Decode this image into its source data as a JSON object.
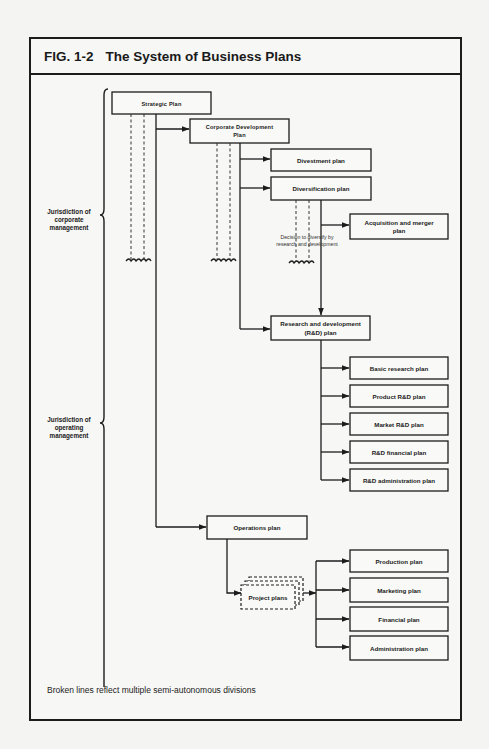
{
  "figure": {
    "number": "FIG. 1-2",
    "title": "The System of Business Plans",
    "footnote": "Broken lines reflect multiple semi-autonomous divisions"
  },
  "jurisdictions": {
    "corporate": [
      "Jurisdiction of",
      "corporate",
      "management"
    ],
    "operating": [
      "Jurisdiction of",
      "operating",
      "management"
    ]
  },
  "plans": {
    "strategic": "Strategic Plan",
    "corporate_development": [
      "Corporate Development",
      "Plan"
    ],
    "divestment": "Divestment plan",
    "diversification": "Diversification plan",
    "acquisition": [
      "Acquisition and merger",
      "plan"
    ],
    "rd": [
      "Research and development",
      "(R&D) plan"
    ],
    "rd_children": [
      "Basic research plan",
      "Product R&D plan",
      "Market R&D plan",
      "R&D financial plan",
      "R&D administration plan"
    ],
    "operations": "Operations plan",
    "project": "Project plans",
    "operations_children": [
      "Production plan",
      "Marketing plan",
      "Financial plan",
      "Administration plan"
    ]
  },
  "annotations": {
    "diversify_decision": [
      "Decision to diversify by",
      "research and development"
    ]
  }
}
